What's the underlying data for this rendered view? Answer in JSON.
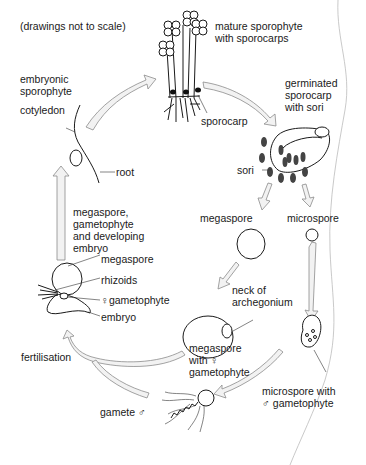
{
  "diagram": {
    "title_fragment": "",
    "note": "(drawings not to scale)",
    "labels": {
      "mature_sporophyte": "mature sporophyte\nwith sporocarps",
      "sporocarp": "sporocarp",
      "germinated_sporocarp": "germinated\nsporocarp\nwith sori",
      "sori": "sori",
      "megaspore": "megaspore",
      "microspore": "microspore",
      "neck_of_archegonium": "neck of\narchegonium",
      "megaspore_with_female_gametophyte": "megaspore\nwith ♀\ngametophyte",
      "microspore_with_male_gametophyte": "microspore with\n♂ gametophyte",
      "gamete_male": "gamete ♂",
      "fertilisation": "fertilisation",
      "megaspore_gametophyte_embryo": "megaspore,\ngametophyte\nand developing\nembryo",
      "megaspore_small": "megaspore",
      "rhizoids": "rhizoids",
      "female_gametophyte": "♀gametophyte",
      "embryo": "embryo",
      "embryonic_sporophyte": "embryonic\nsporophyte",
      "cotyledon": "cotyledon",
      "root": "root"
    },
    "stages": [
      "mature sporophyte with sporocarps",
      "germinated sporocarp with sori",
      "megaspore / microspore",
      "megaspore with female gametophyte / microspore with male gametophyte",
      "gamete male",
      "fertilisation",
      "megaspore, gametophyte and developing embryo",
      "embryonic sporophyte"
    ],
    "colors": {
      "ink": "#1a1a1a",
      "arrow_fill": "#f2f2f2",
      "arrow_stroke": "#8c8c8c",
      "background": "#ffffff"
    }
  }
}
